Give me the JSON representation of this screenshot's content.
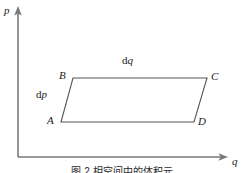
{
  "figure": {
    "axes": {
      "y_label": "p",
      "x_label": "q",
      "origin": {
        "x": 18,
        "y": 157
      },
      "y_top": {
        "x": 18,
        "y": 8
      },
      "x_right": {
        "x": 228,
        "y": 157
      },
      "stroke_color": "#7a7a7a"
    },
    "parallelogram": {
      "stroke_color": "#555555",
      "fill": "none",
      "vertices": [
        {
          "name": "A",
          "label": "A",
          "x": 61,
          "y": 122
        },
        {
          "name": "B",
          "label": "B",
          "x": 73,
          "y": 78
        },
        {
          "name": "C",
          "label": "C",
          "x": 207,
          "y": 78
        },
        {
          "name": "D",
          "label": "D",
          "x": 194,
          "y": 122
        }
      ]
    },
    "annotations": [
      {
        "name": "dq-label",
        "prefix": "d",
        "variable": "q",
        "x": 128,
        "y": 61
      },
      {
        "name": "dp-label",
        "prefix": "d",
        "variable": "p",
        "x": 40,
        "y": 92
      }
    ],
    "caption": "图 2  相空间中的体积元"
  }
}
